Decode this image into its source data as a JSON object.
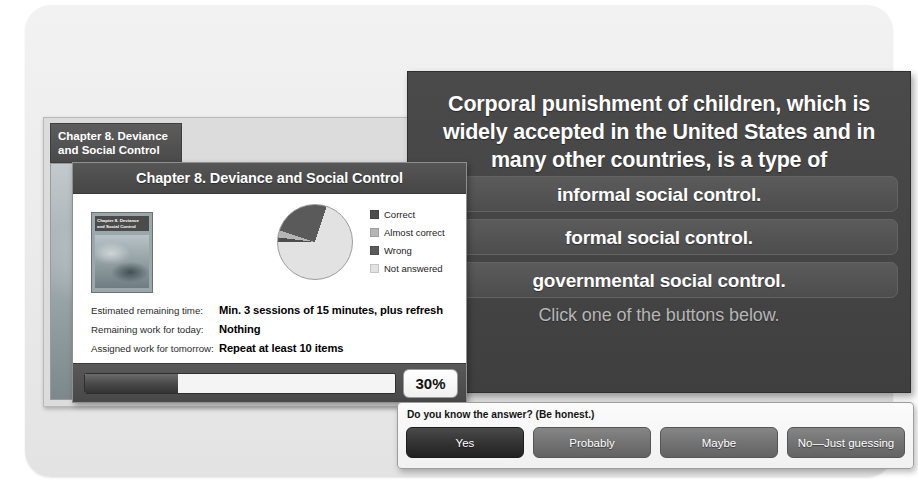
{
  "background_window": {
    "title_line1": "Chapter 8. Deviance",
    "title_line2": "and Social Control"
  },
  "stats_window": {
    "title": "Chapter 8. Deviance and Social Control",
    "book_cover": {
      "title_line1": "Chapter 8. Deviance",
      "title_line2": "and Social Control"
    },
    "rows": [
      {
        "label": "Estimated remaining time:",
        "value": "Min. 3 sessions of 15 minutes, plus refresh"
      },
      {
        "label": "Remaining work for today:",
        "value": "Nothing"
      },
      {
        "label": "Assigned work for tomorrow:",
        "value": "Repeat at least 10 items"
      }
    ],
    "progress": {
      "percent_label": "30%",
      "percent_value": 30
    }
  },
  "chart_data": {
    "type": "pie",
    "title": "",
    "categories": [
      "Correct",
      "Almost correct",
      "Wrong",
      "Not answered"
    ],
    "values": [
      2,
      3,
      25,
      70
    ],
    "colors": [
      "#4d4d4d",
      "#b5b5b5",
      "#5a5a5a",
      "#e2e2e2"
    ],
    "legend_position": "right",
    "unit": "percent"
  },
  "question_panel": {
    "question": "Corporal punishment of children, which is widely accepted in the United States and in many other countries, is a type of",
    "options": [
      "informal social control.",
      "formal social control.",
      "governmental social control."
    ],
    "hint": "Click one of the buttons below."
  },
  "confidence_panel": {
    "question": "Do you know the answer? (Be honest.)",
    "buttons": [
      {
        "label": "Yes",
        "state": "selected"
      },
      {
        "label": "Probably",
        "state": "normal"
      },
      {
        "label": "Maybe",
        "state": "normal"
      },
      {
        "label": "No—Just guessing",
        "state": "normal"
      }
    ]
  }
}
